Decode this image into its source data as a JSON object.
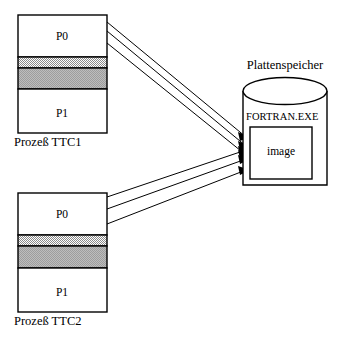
{
  "figure": {
    "background_color": "#ffffff",
    "line_color": "#000000",
    "band_fill_color": "#b0b0b0",
    "band_fill_color_light": "#c8c8c8",
    "box_fill_color": "#ffffff"
  },
  "processes": [
    {
      "id": "ttc1",
      "caption": "Prozeß TTC1",
      "regions": [
        {
          "name": "p0",
          "label": "P0",
          "fill": "white"
        },
        {
          "name": "shared-band-upper",
          "label": "",
          "fill": "gray-light"
        },
        {
          "name": "shared-band-lower",
          "label": "",
          "fill": "gray"
        },
        {
          "name": "p1",
          "label": "P1",
          "fill": "white"
        }
      ],
      "arrow_count": 3
    },
    {
      "id": "ttc2",
      "caption": "Prozeß TTC2",
      "regions": [
        {
          "name": "p0",
          "label": "P0",
          "fill": "white"
        },
        {
          "name": "shared-band-upper",
          "label": "",
          "fill": "gray-light"
        },
        {
          "name": "shared-band-lower",
          "label": "",
          "fill": "gray"
        },
        {
          "name": "p1",
          "label": "P1",
          "fill": "white"
        }
      ],
      "arrow_count": 3
    }
  ],
  "disk": {
    "title": "Plattenspeicher",
    "file_label": "FORTRAN.EXE",
    "image_label": "image"
  }
}
